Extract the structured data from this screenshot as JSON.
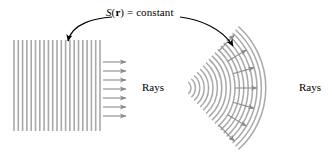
{
  "figure": {
    "background_color": "#ffffff",
    "width": 332,
    "height": 164
  },
  "annotations": {
    "wavefront_label": {
      "s_symbol": "S",
      "open_paren": "(",
      "r_symbol": "r",
      "close_paren": ")",
      "equals_constant": " = constant",
      "full_text": "S(r) = constant",
      "color": "#000000"
    },
    "rays_label_left": {
      "text": "Rays",
      "color": "#000000"
    },
    "rays_label_right": {
      "text": "Rays",
      "color": "#000000"
    }
  },
  "colors": {
    "wavefront_line": "#a9a9a9",
    "ray_arrow": "#8c8c8c",
    "pointer_arrow": "#000000",
    "text": "#000000"
  },
  "plane_wavefronts": {
    "description": "vertical parallel lines",
    "count": 21,
    "x_start": 14,
    "x_spacing": 4.3,
    "y_top": 40,
    "y_bottom": 131,
    "stroke_width": 1.6
  },
  "spherical_wavefronts": {
    "description": "concentric circular arcs",
    "count": 18,
    "center_x": 183,
    "center_y": 88,
    "radius_start": 8,
    "radius_step": 4.4,
    "angle_start_deg": -48,
    "angle_end_deg": 48,
    "stroke_width": 1.5
  },
  "plane_rays": {
    "count": 7,
    "x_start": 103,
    "x_end": 126,
    "y_first": 62,
    "y_spacing": 9
  },
  "spherical_rays": {
    "count": 7,
    "angles_deg": [
      -46,
      -31,
      -16,
      0,
      16,
      31,
      46
    ],
    "radius_start": 52,
    "radius_end": 74
  },
  "pointer_arrows": [
    {
      "name": "pointer-to-plane-wavefront",
      "from_x": 112,
      "from_y": 17,
      "to_x": 68,
      "to_y": 41
    },
    {
      "name": "pointer-to-spherical-wavefront",
      "from_x": 180,
      "from_y": 17,
      "to_x": 233,
      "to_y": 46
    }
  ]
}
